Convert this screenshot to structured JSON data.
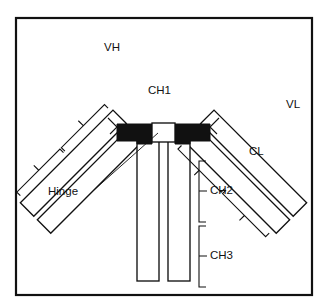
{
  "figure": {
    "background_color": "#ffffff",
    "line_color": "#111111",
    "hinge_fill_color": "#111111",
    "chain_fill_color": "#ffffff"
  },
  "labels": {
    "vh": "VH",
    "ch1": "CH1",
    "vl": "VL",
    "cl": "CL",
    "hinge": "Hinge",
    "ch2": "CH2",
    "ch3": "CH3"
  },
  "regions": [
    {
      "id": "vh",
      "label": "VH",
      "chain": "heavy",
      "arm": "left",
      "position": "distal"
    },
    {
      "id": "ch1",
      "label": "CH1",
      "chain": "heavy",
      "arm": "left",
      "position": "proximal"
    },
    {
      "id": "vl",
      "label": "VL",
      "chain": "light",
      "arm": "right",
      "position": "distal"
    },
    {
      "id": "cl",
      "label": "CL",
      "chain": "light",
      "arm": "right",
      "position": "proximal"
    },
    {
      "id": "hinge",
      "label": "Hinge",
      "chain": "heavy",
      "arm": "center",
      "position": "hinge"
    },
    {
      "id": "ch2",
      "label": "CH2",
      "chain": "heavy",
      "arm": "stem",
      "position": "upper"
    },
    {
      "id": "ch3",
      "label": "CH3",
      "chain": "heavy",
      "arm": "stem",
      "position": "lower"
    }
  ]
}
